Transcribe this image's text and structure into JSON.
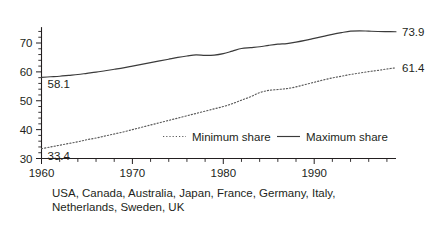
{
  "chart_data": {
    "type": "line",
    "title": "",
    "subtitle": "",
    "xlabel": "",
    "ylabel": "",
    "xlim": [
      1960,
      1999
    ],
    "ylim": [
      30,
      75
    ],
    "grid": false,
    "legend_position": "inside-bottom-center",
    "x_ticks_major": [
      1960,
      1970,
      1980,
      1990
    ],
    "x_tick_labels": [
      "1960",
      "1970",
      "1980",
      "1990"
    ],
    "x_tick_step_minor": 2,
    "y_ticks_major": [
      30,
      40,
      50,
      60,
      70
    ],
    "y_tick_labels": [
      "30",
      "40",
      "50",
      "60",
      "70"
    ],
    "y_tick_step_minor": 2,
    "annotations": [
      {
        "name": "min-start-value",
        "text": "33.4",
        "series": "Minimum share",
        "x": 1960,
        "y": 33.4
      },
      {
        "name": "max-start-value",
        "text": "58.1",
        "series": "Maximum share",
        "x": 1960,
        "y": 58.1
      },
      {
        "name": "min-end-value",
        "text": "61.4",
        "series": "Minimum share",
        "x": 1999,
        "y": 61.4
      },
      {
        "name": "max-end-value",
        "text": "73.9",
        "series": "Maximum share",
        "x": 1999,
        "y": 73.9
      }
    ],
    "x": [
      1960,
      1961,
      1962,
      1963,
      1964,
      1965,
      1966,
      1967,
      1968,
      1969,
      1970,
      1971,
      1972,
      1973,
      1974,
      1975,
      1976,
      1977,
      1978,
      1979,
      1980,
      1981,
      1982,
      1983,
      1984,
      1985,
      1986,
      1987,
      1988,
      1989,
      1990,
      1991,
      1992,
      1993,
      1994,
      1995,
      1996,
      1997,
      1998,
      1999
    ],
    "series": [
      {
        "name": "Minimum share",
        "style": "dotted",
        "color": "#5a5a5a",
        "values": [
          33.4,
          34.0,
          34.6,
          35.2,
          35.8,
          36.5,
          37.1,
          37.8,
          38.5,
          39.2,
          40.0,
          40.8,
          41.6,
          42.4,
          43.2,
          44.0,
          44.8,
          45.6,
          46.4,
          47.2,
          48.0,
          49.0,
          50.2,
          51.4,
          52.8,
          53.6,
          53.9,
          54.2,
          54.8,
          55.6,
          56.4,
          57.2,
          57.9,
          58.5,
          59.1,
          59.6,
          60.1,
          60.5,
          61.0,
          61.4
        ]
      },
      {
        "name": "Maximum share",
        "style": "solid",
        "color": "#3b3b3b",
        "values": [
          58.1,
          58.3,
          58.5,
          58.8,
          59.1,
          59.5,
          59.9,
          60.4,
          60.9,
          61.4,
          62.0,
          62.6,
          63.2,
          63.8,
          64.4,
          65.0,
          65.5,
          65.9,
          65.7,
          65.8,
          66.3,
          67.2,
          68.1,
          68.4,
          68.7,
          69.2,
          69.6,
          69.8,
          70.3,
          70.9,
          71.6,
          72.3,
          73.0,
          73.6,
          74.1,
          74.2,
          74.1,
          74.0,
          73.95,
          73.9
        ]
      }
    ]
  },
  "legend": {
    "items": [
      {
        "label": "Minimum share",
        "style": "dotted"
      },
      {
        "label": "Maximum share",
        "style": "solid"
      }
    ]
  },
  "caption": {
    "line1": "USA, Canada, Australia, Japan, France, Germany, Italy,",
    "line2": "Netherlands, Sweden, UK"
  }
}
